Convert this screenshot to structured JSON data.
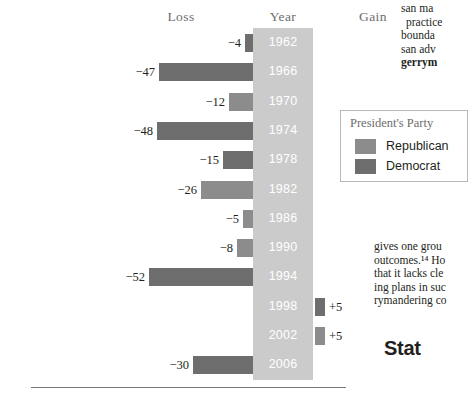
{
  "headers": {
    "loss": "Loss",
    "year": "Year",
    "gain": "Gain"
  },
  "legend": {
    "title": "President's Party",
    "items": [
      {
        "label": "Republican",
        "color": "#8c8c8c",
        "party": "republican"
      },
      {
        "label": "Democrat",
        "color": "#6e6e6e",
        "party": "democrat"
      }
    ]
  },
  "colors": {
    "republican": "#8c8c8c",
    "democrat": "#6e6e6e",
    "year_band": "#cbcbcb",
    "year_text": "#ffffff",
    "header_text": "#6d6d6d",
    "rule": "#77787b"
  },
  "page_text": {
    "top_lines": [
      "san ma",
      "practice",
      "bounda",
      "san adv",
      "gerrym"
    ],
    "mid_lines": [
      "gives one grou",
      "outcomes.¹⁴ Ho",
      "that it lacks cle",
      "ing plans in suc",
      "rymandering co"
    ],
    "section_heading": "Stat"
  },
  "chart_data": {
    "type": "bar",
    "orientation": "horizontal-diverging",
    "title": "",
    "xlabel": "",
    "ylabel": "Year",
    "categories": [
      "1962",
      "1966",
      "1970",
      "1974",
      "1978",
      "1982",
      "1986",
      "1990",
      "1994",
      "1998",
      "2002",
      "2006"
    ],
    "values": [
      -4,
      -47,
      -12,
      -48,
      -15,
      -26,
      -5,
      -8,
      -52,
      5,
      5,
      -30
    ],
    "value_labels": [
      "−4",
      "−47",
      "−12",
      "−48",
      "−15",
      "−26",
      "−5",
      "−8",
      "−52",
      "+5",
      "+5",
      "−30"
    ],
    "party": [
      "democrat",
      "democrat",
      "republican",
      "democrat",
      "democrat",
      "republican",
      "republican",
      "republican",
      "democrat",
      "democrat",
      "republican",
      "democrat"
    ],
    "legend_position": "right",
    "grid": false,
    "xlim": [
      -55,
      10
    ],
    "left_axis_label": "Loss",
    "right_axis_label": "Gain"
  }
}
